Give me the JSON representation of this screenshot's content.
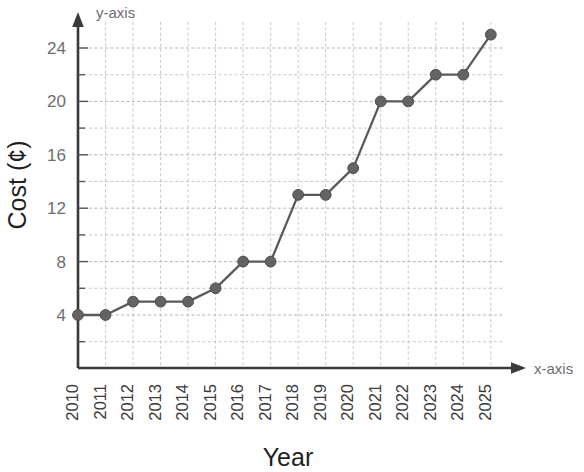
{
  "chart_data": {
    "type": "line",
    "title": "",
    "xlabel": "Year",
    "ylabel": "Cost (¢)",
    "x_axis_name": "x-axis",
    "y_axis_name": "y-axis",
    "categories": [
      "2010",
      "2011",
      "2012",
      "2013",
      "2014",
      "2015",
      "2016",
      "2017",
      "2018",
      "2019",
      "2020",
      "2021",
      "2022",
      "2023",
      "2024",
      "2025"
    ],
    "values": [
      4,
      4,
      5,
      5,
      5,
      6,
      8,
      8,
      13,
      13,
      15,
      20,
      20,
      22,
      22,
      25
    ],
    "series": [
      {
        "name": "Cost",
        "values": [
          4,
          4,
          5,
          5,
          5,
          6,
          8,
          8,
          13,
          13,
          15,
          20,
          20,
          22,
          22,
          25
        ]
      }
    ],
    "y_tick_labels": [
      "4",
      "8",
      "12",
      "16",
      "20",
      "24"
    ],
    "y_tick_values": [
      4,
      8,
      12,
      16,
      20,
      24
    ],
    "y_minor_tick_values": [
      2,
      6,
      10,
      14,
      18,
      22,
      26
    ],
    "ylim": [
      0,
      26
    ],
    "xlim_index": [
      0,
      15
    ],
    "grid": true,
    "legend": null,
    "marker": "circle",
    "line_color": "#5a5a5a",
    "marker_color": "#636363",
    "grid_color": "#b9b9c4",
    "axis_color": "#3a3a3a"
  }
}
